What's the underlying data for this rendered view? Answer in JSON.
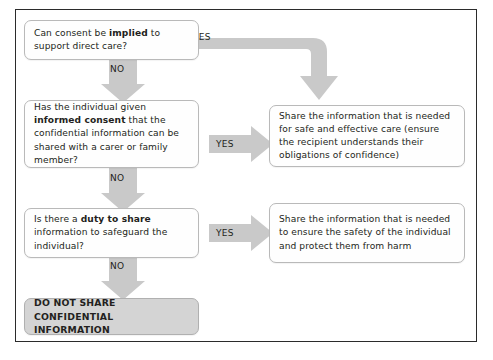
{
  "diagram": {
    "colors": {
      "frame_border": "#2b2b2b",
      "box_border": "#b9b9b9",
      "box_fill": "#fefefe",
      "terminal_fill": "#d4d4d4",
      "arrow_fill": "#c9c9c9",
      "text": "#231f20"
    },
    "decisions": [
      {
        "id": "decision-implied-consent",
        "segments": [
          {
            "text": "Can consent be ",
            "bold": false
          },
          {
            "text": "implied",
            "bold": true
          },
          {
            "text": " to support direct care?",
            "bold": false
          }
        ]
      },
      {
        "id": "decision-informed-consent",
        "segments": [
          {
            "text": "Has the individual given ",
            "bold": false
          },
          {
            "text": "informed consent",
            "bold": true
          },
          {
            "text": " that the confidential information can be shared with a carer or family member?",
            "bold": false
          }
        ]
      },
      {
        "id": "decision-duty-to-share",
        "segments": [
          {
            "text": "Is there a ",
            "bold": false
          },
          {
            "text": "duty to share",
            "bold": true
          },
          {
            "text": " information to safeguard the individual?",
            "bold": false
          }
        ]
      }
    ],
    "outcomes": [
      {
        "id": "outcome-safe-effective-care",
        "text": "Share the information that is needed for safe and effective care (ensure the recipient understands their obligations of confidence)"
      },
      {
        "id": "outcome-safety-protect-harm",
        "text": "Share the information that is needed to ensure the safety of the individual and protect them from harm"
      }
    ],
    "terminal": {
      "id": "terminal-do-not-share",
      "text": "DO NOT SHARE CONFIDENTIAL INFORMATION"
    },
    "labels": {
      "yes": "YES",
      "no": "NO"
    }
  }
}
